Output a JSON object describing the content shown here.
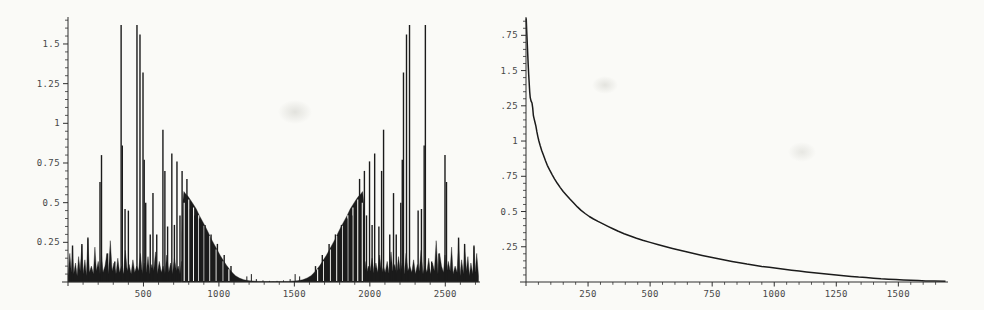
{
  "colors": {
    "paper": "#fafaf7",
    "ink": "#1b1b1b",
    "axis": "#2f2f2f",
    "tick_label": "#474747",
    "smudge": "#bebeb6"
  },
  "chart_data": [
    {
      "name": "symmetric-spectrum-plot",
      "type": "bar",
      "title": "",
      "xlabel": "",
      "ylabel": "",
      "grid": false,
      "legend": null,
      "xlim": [
        0,
        2730
      ],
      "ylim": [
        0,
        1.67
      ],
      "x_axis": {
        "majors": [
          500,
          1000,
          1500,
          2000,
          2500
        ],
        "labels": [
          "500",
          "1000",
          "1500",
          "2000",
          "2500"
        ],
        "minor_step": 100,
        "minor_max": 2700
      },
      "y_axis": {
        "majors": [
          0.25,
          0.5,
          0.75,
          1,
          1.25,
          1.5
        ],
        "labels": [
          "0.25",
          "0.5",
          "0.75",
          "1",
          "1.25",
          "1.5"
        ],
        "minor_step": 0.05,
        "minor_max": 1.65
      },
      "mirror_sum": 2720,
      "floor": [
        [
          0,
          0.04
        ],
        [
          12,
          0.18
        ],
        [
          22,
          0.06
        ],
        [
          30,
          0.22
        ],
        [
          38,
          0.05
        ],
        [
          50,
          0.12
        ],
        [
          60,
          0.04
        ],
        [
          70,
          0.16
        ],
        [
          80,
          0.07
        ],
        [
          92,
          0.23
        ],
        [
          100,
          0.05
        ],
        [
          112,
          0.14
        ],
        [
          122,
          0.04
        ],
        [
          132,
          0.27
        ],
        [
          142,
          0.06
        ],
        [
          155,
          0.1
        ],
        [
          168,
          0.05
        ],
        [
          178,
          0.22
        ],
        [
          188,
          0.07
        ],
        [
          200,
          0.13
        ],
        [
          212,
          0.05
        ],
        [
          222,
          0.17
        ],
        [
          232,
          0.06
        ],
        [
          245,
          0.1
        ],
        [
          258,
          0.18
        ],
        [
          268,
          0.05
        ],
        [
          280,
          0.26
        ],
        [
          292,
          0.07
        ],
        [
          305,
          0.12
        ],
        [
          318,
          0.05
        ],
        [
          330,
          0.15
        ],
        [
          342,
          0.06
        ],
        [
          355,
          0.1
        ],
        [
          368,
          0.05
        ],
        [
          380,
          0.2
        ],
        [
          392,
          0.07
        ],
        [
          405,
          0.11
        ],
        [
          418,
          0.05
        ],
        [
          430,
          0.14
        ],
        [
          442,
          0.06
        ],
        [
          455,
          0.1
        ],
        [
          468,
          0.07
        ],
        [
          480,
          0.18
        ],
        [
          492,
          0.05
        ],
        [
          505,
          0.12
        ],
        [
          518,
          0.06
        ],
        [
          530,
          0.16
        ],
        [
          542,
          0.05
        ],
        [
          555,
          0.11
        ],
        [
          568,
          0.07
        ],
        [
          580,
          0.19
        ],
        [
          592,
          0.05
        ],
        [
          605,
          0.13
        ],
        [
          618,
          0.06
        ],
        [
          630,
          0.1
        ],
        [
          642,
          0.05
        ],
        [
          655,
          0.17
        ],
        [
          668,
          0.06
        ],
        [
          680,
          0.12
        ],
        [
          692,
          0.05
        ],
        [
          705,
          0.15
        ],
        [
          718,
          0.07
        ],
        [
          730,
          0.1
        ],
        [
          742,
          0.05
        ],
        [
          752,
          0.13
        ]
      ],
      "envelope": [
        [
          755,
          0.3
        ],
        [
          760,
          0.5
        ],
        [
          768,
          0.57
        ],
        [
          780,
          0.555
        ],
        [
          795,
          0.54
        ],
        [
          810,
          0.52
        ],
        [
          830,
          0.49
        ],
        [
          850,
          0.46
        ],
        [
          870,
          0.42
        ],
        [
          890,
          0.385
        ],
        [
          910,
          0.35
        ],
        [
          930,
          0.31
        ],
        [
          950,
          0.27
        ],
        [
          970,
          0.235
        ],
        [
          990,
          0.2
        ],
        [
          1010,
          0.165
        ],
        [
          1030,
          0.135
        ],
        [
          1050,
          0.105
        ],
        [
          1070,
          0.08
        ],
        [
          1090,
          0.058
        ],
        [
          1110,
          0.04
        ],
        [
          1135,
          0.025
        ],
        [
          1165,
          0.014
        ],
        [
          1200,
          0.008
        ],
        [
          1260,
          0.004
        ],
        [
          1360,
          0.003
        ]
      ],
      "spikes": [
        [
          30,
          0.23
        ],
        [
          92,
          0.24
        ],
        [
          132,
          0.28
        ],
        [
          212,
          0.63
        ],
        [
          222,
          0.8
        ],
        [
          262,
          0.18
        ],
        [
          310,
          0.13
        ],
        [
          352,
          1.62
        ],
        [
          360,
          0.86
        ],
        [
          378,
          0.46
        ],
        [
          400,
          0.45
        ],
        [
          457,
          1.62
        ],
        [
          477,
          1.56
        ],
        [
          497,
          1.32
        ],
        [
          505,
          0.77
        ],
        [
          515,
          0.5
        ],
        [
          545,
          0.3
        ],
        [
          563,
          0.56
        ],
        [
          588,
          0.3
        ],
        [
          629,
          0.96
        ],
        [
          642,
          0.7
        ],
        [
          660,
          0.35
        ],
        [
          688,
          0.81
        ],
        [
          705,
          0.36
        ],
        [
          722,
          0.76
        ],
        [
          742,
          0.42
        ],
        [
          756,
          0.7
        ],
        [
          788,
          0.65
        ],
        [
          812,
          0.46
        ],
        [
          840,
          0.42
        ],
        [
          872,
          0.4
        ],
        [
          908,
          0.36
        ],
        [
          948,
          0.3
        ],
        [
          990,
          0.24
        ],
        [
          1035,
          0.17
        ],
        [
          1080,
          0.1
        ]
      ],
      "gaps": [
        [
          770,
          0.5
        ],
        [
          800,
          0.52
        ],
        [
          832,
          0.47
        ],
        [
          866,
          0.42
        ],
        [
          902,
          0.355
        ],
        [
          940,
          0.29
        ],
        [
          982,
          0.205
        ],
        [
          1028,
          0.13
        ],
        [
          1066,
          0.08
        ]
      ],
      "bumps": [
        [
          1185,
          0.035
        ],
        [
          1215,
          0.05
        ],
        [
          1248,
          0.018
        ],
        [
          1292,
          0.01
        ],
        [
          1335,
          0.007
        ]
      ]
    },
    {
      "name": "decay-curve-plot",
      "type": "line",
      "title": "",
      "xlabel": "",
      "ylabel": "",
      "grid": false,
      "legend": null,
      "xlim": [
        0,
        1700
      ],
      "ylim": [
        0,
        1.88
      ],
      "x_axis": {
        "majors": [
          250,
          500,
          750,
          1000,
          1250,
          1500
        ],
        "labels": [
          "250",
          "500",
          "750",
          "1000",
          "1250",
          "1500"
        ],
        "minor_step": 50,
        "minor_max": 1690
      },
      "y_axis": {
        "majors": [
          0.25,
          0.5,
          0.75,
          1,
          1.25,
          1.5,
          1.75
        ],
        "labels": [
          "0.25",
          "0.5",
          "0.75",
          "1",
          "1.25",
          "1.5",
          "1.75"
        ],
        "minor_step": 0.05,
        "minor_max": 1.85
      },
      "points": [
        [
          1,
          1.87
        ],
        [
          3,
          1.78
        ],
        [
          5,
          1.7
        ],
        [
          7,
          1.62
        ],
        [
          9,
          1.54
        ],
        [
          11,
          1.47
        ],
        [
          13,
          1.41
        ],
        [
          15,
          1.35
        ],
        [
          17,
          1.31
        ],
        [
          20,
          1.285
        ],
        [
          24,
          1.27
        ],
        [
          27,
          1.235
        ],
        [
          30,
          1.18
        ],
        [
          33,
          1.155
        ],
        [
          36,
          1.135
        ],
        [
          40,
          1.105
        ],
        [
          44,
          1.065
        ],
        [
          48,
          1.03
        ],
        [
          52,
          1.0
        ],
        [
          57,
          0.97
        ],
        [
          63,
          0.935
        ],
        [
          70,
          0.9
        ],
        [
          78,
          0.862
        ],
        [
          86,
          0.828
        ],
        [
          95,
          0.795
        ],
        [
          105,
          0.762
        ],
        [
          115,
          0.732
        ],
        [
          126,
          0.7
        ],
        [
          138,
          0.67
        ],
        [
          150,
          0.642
        ],
        [
          163,
          0.615
        ],
        [
          177,
          0.588
        ],
        [
          192,
          0.56
        ],
        [
          207,
          0.533
        ],
        [
          222,
          0.508
        ],
        [
          238,
          0.486
        ],
        [
          255,
          0.465
        ],
        [
          272,
          0.447
        ],
        [
          290,
          0.43
        ],
        [
          310,
          0.412
        ],
        [
          330,
          0.395
        ],
        [
          350,
          0.378
        ],
        [
          372,
          0.36
        ],
        [
          395,
          0.343
        ],
        [
          420,
          0.326
        ],
        [
          445,
          0.31
        ],
        [
          470,
          0.296
        ],
        [
          500,
          0.281
        ],
        [
          530,
          0.266
        ],
        [
          560,
          0.252
        ],
        [
          590,
          0.238
        ],
        [
          620,
          0.225
        ],
        [
          650,
          0.212
        ],
        [
          680,
          0.2
        ],
        [
          710,
          0.189
        ],
        [
          740,
          0.178
        ],
        [
          770,
          0.167
        ],
        [
          800,
          0.156
        ],
        [
          830,
          0.146
        ],
        [
          860,
          0.136
        ],
        [
          890,
          0.127
        ],
        [
          920,
          0.119
        ],
        [
          950,
          0.111
        ],
        [
          980,
          0.104
        ],
        [
          1010,
          0.097
        ],
        [
          1040,
          0.09
        ],
        [
          1070,
          0.084
        ],
        [
          1100,
          0.078
        ],
        [
          1130,
          0.072
        ],
        [
          1160,
          0.066
        ],
        [
          1190,
          0.06
        ],
        [
          1220,
          0.055
        ],
        [
          1250,
          0.05
        ],
        [
          1280,
          0.045
        ],
        [
          1310,
          0.04
        ],
        [
          1340,
          0.035
        ],
        [
          1370,
          0.031
        ],
        [
          1400,
          0.027
        ],
        [
          1430,
          0.023
        ],
        [
          1460,
          0.02
        ],
        [
          1490,
          0.017
        ],
        [
          1520,
          0.014
        ],
        [
          1550,
          0.012
        ],
        [
          1580,
          0.01
        ],
        [
          1610,
          0.008
        ],
        [
          1645,
          0.007
        ],
        [
          1690,
          0.006
        ]
      ]
    }
  ]
}
